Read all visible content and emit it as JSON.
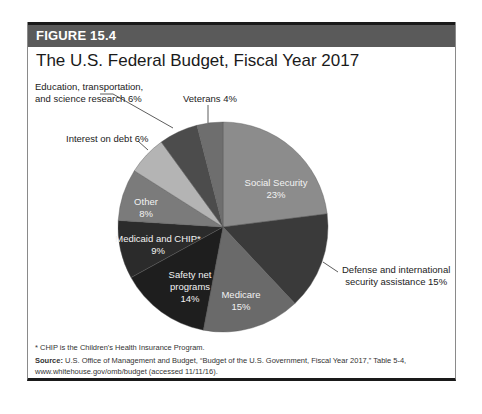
{
  "figure": {
    "label": "FIGURE 15.4",
    "title": "The U.S. Federal Budget, Fiscal Year 2017"
  },
  "chart_data": {
    "type": "pie",
    "title": "The U.S. Federal Budget, Fiscal Year 2017",
    "categories": [
      "Social Security",
      "Defense and international security assistance",
      "Medicare",
      "Safety net programs",
      "Medicaid and CHIP*",
      "Other",
      "Interest on debt",
      "Education, transportation, and science research",
      "Veterans"
    ],
    "values": [
      23,
      15,
      15,
      14,
      9,
      8,
      6,
      6,
      4
    ],
    "unit": "%",
    "colors": [
      "#8c8c8c",
      "#3a3a3a",
      "#6a6a6a",
      "#1e1e1e",
      "#2b2b2b",
      "#7b7b7b",
      "#b4b4b4",
      "#4c4c4c",
      "#6e6e6e"
    ],
    "start_angle": "12 o'clock, clockwise"
  },
  "labels": {
    "social_security": [
      "Social Security",
      "23%"
    ],
    "defense": [
      "Defense and international",
      "security assistance 15%"
    ],
    "medicare": [
      "Medicare",
      "15%"
    ],
    "safety_net": [
      "Safety net",
      "programs",
      "14%"
    ],
    "medicaid": [
      "Medicaid and CHIP*",
      "9%"
    ],
    "other": [
      "Other",
      "8%"
    ],
    "interest": "Interest on debt 6%",
    "education": [
      "Education, transportation,",
      "and science research 6%"
    ],
    "veterans": "Veterans 4%"
  },
  "footnote": "* CHIP is the Children's Health Insurance Program.",
  "source": {
    "label": "Source:",
    "text": " U.S. Office of Management and Budget, “Budget of the U.S. Government, Fiscal Year 2017,” Table 5-4,",
    "text2": "www.whitehouse.gov/omb/budget (accessed 11/11/16)."
  }
}
